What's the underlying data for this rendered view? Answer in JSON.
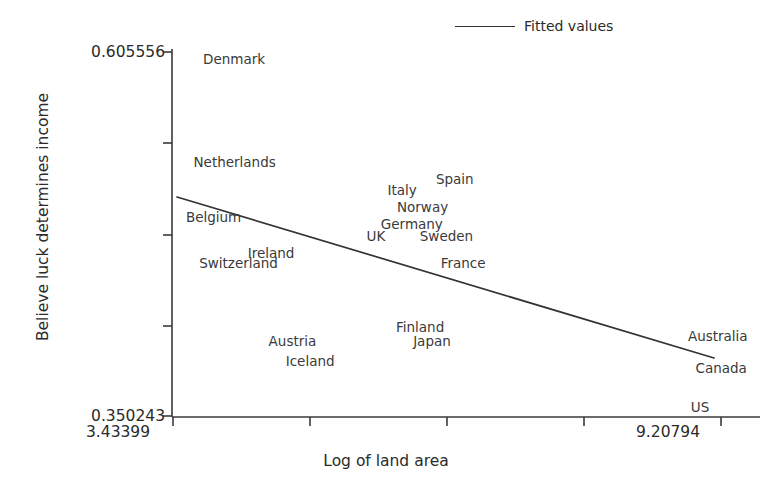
{
  "chart_data": {
    "type": "scatter",
    "title": "",
    "xlabel": "Log of land area",
    "ylabel": "Believe luck determines income",
    "xlim": [
      3.43399,
      9.20794
    ],
    "ylim": [
      0.350243,
      0.605556
    ],
    "x_tick_labels": [
      "3.43399",
      "9.20794"
    ],
    "y_tick_labels": [
      "0.605556",
      "0.350243"
    ],
    "grid": false,
    "legend": {
      "position": "top-right",
      "entries": [
        {
          "label": "Fitted values",
          "marker": "line",
          "color": "#333333"
        }
      ]
    },
    "point_marker": "text-label",
    "points": [
      {
        "label": "Denmark",
        "x": 3.76,
        "y": 0.6
      },
      {
        "label": "Netherlands",
        "x": 3.66,
        "y": 0.528
      },
      {
        "label": "Belgium",
        "x": 3.58,
        "y": 0.489
      },
      {
        "label": "Ireland",
        "x": 4.23,
        "y": 0.464
      },
      {
        "label": "Switzerland",
        "x": 3.72,
        "y": 0.457
      },
      {
        "label": "Italy",
        "x": 5.7,
        "y": 0.508
      },
      {
        "label": "Spain",
        "x": 6.21,
        "y": 0.516
      },
      {
        "label": "Norway",
        "x": 5.8,
        "y": 0.496
      },
      {
        "label": "Germany",
        "x": 5.63,
        "y": 0.484
      },
      {
        "label": "UK",
        "x": 5.48,
        "y": 0.476
      },
      {
        "label": "Sweden",
        "x": 6.04,
        "y": 0.476
      },
      {
        "label": "France",
        "x": 6.26,
        "y": 0.457
      },
      {
        "label": "Finland",
        "x": 5.79,
        "y": 0.412
      },
      {
        "label": "Japan",
        "x": 5.97,
        "y": 0.402
      },
      {
        "label": "Austria",
        "x": 4.45,
        "y": 0.402
      },
      {
        "label": "Iceland",
        "x": 4.63,
        "y": 0.388
      },
      {
        "label": "Australia",
        "x": 8.86,
        "y": 0.406
      },
      {
        "label": "Canada",
        "x": 8.94,
        "y": 0.383
      },
      {
        "label": "US",
        "x": 8.89,
        "y": 0.356
      }
    ],
    "fitted_line": {
      "name": "Fitted values",
      "x_start": 3.5,
      "y_start": 0.4965,
      "x_end": 9.11,
      "y_end": 0.393,
      "color": "#333333"
    }
  }
}
